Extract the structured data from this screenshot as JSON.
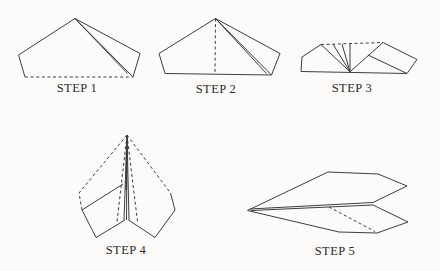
{
  "colors": {
    "background": "#fcfbf9",
    "line": "#3e3e3e",
    "text": "#2a2a2a"
  },
  "steps": [
    {
      "label": "STEP 1"
    },
    {
      "label": "STEP 2"
    },
    {
      "label": "STEP 3"
    },
    {
      "label": "STEP 4"
    },
    {
      "label": "STEP 5"
    }
  ]
}
